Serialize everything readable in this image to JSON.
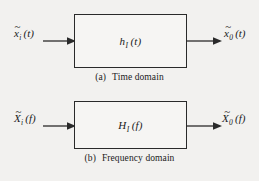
{
  "figure": {
    "type": "block-diagram",
    "panels": [
      {
        "id": "a",
        "caption_tag": "(a)",
        "caption_text": "Time domain",
        "input": {
          "symbol": "x",
          "accent": "tilde",
          "subscript": "i",
          "argument": "(t)"
        },
        "block": {
          "symbol": "h",
          "subscript": "I",
          "argument": "(t)",
          "label": "h"
        },
        "output": {
          "symbol": "x",
          "accent": "tilde",
          "subscript": "0",
          "argument": "(t)"
        },
        "arrow_in_name": "input-arrow",
        "arrow_out_name": "output-arrow"
      },
      {
        "id": "b",
        "caption_tag": "(b)",
        "caption_text": "Frequency domain",
        "input": {
          "symbol": "X",
          "accent": "tilde",
          "subscript": "i",
          "argument": "(f)"
        },
        "block": {
          "symbol": "H",
          "subscript": "I",
          "argument": "(f)",
          "label": "H"
        },
        "output": {
          "symbol": "X",
          "accent": "tilde",
          "subscript": "0",
          "argument": "(f)"
        },
        "arrow_in_name": "input-arrow",
        "arrow_out_name": "output-arrow"
      }
    ],
    "accent_glyph": "~",
    "colors": {
      "background": "#f2f1ef",
      "stroke": "#2a2a2a",
      "text": "#1a1a1a",
      "block_fill": "#f6f5f3"
    }
  }
}
